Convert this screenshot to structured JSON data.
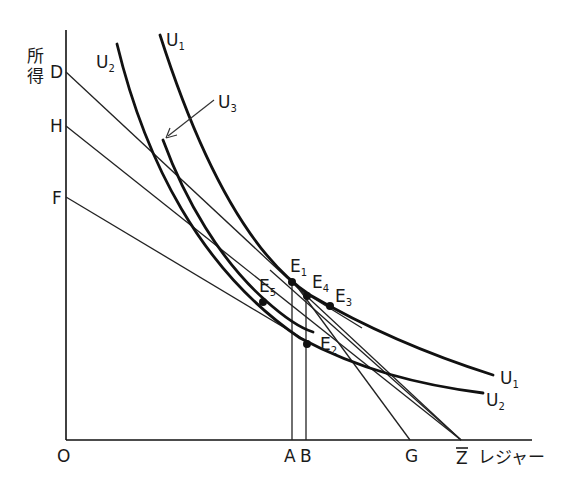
{
  "axes": {
    "y_label": "所得",
    "x_label": "レジャー",
    "origin": "O",
    "y_ticks": [
      "D",
      "H",
      "F"
    ],
    "x_ticks": [
      "A",
      "B",
      "G",
      "Z̄"
    ]
  },
  "curves": [
    {
      "name": "U1",
      "label": "U",
      "sub": "1"
    },
    {
      "name": "U2",
      "label": "U",
      "sub": "2"
    },
    {
      "name": "U3",
      "label": "U",
      "sub": "3"
    }
  ],
  "points": [
    {
      "name": "E1",
      "label": "E",
      "sub": "1"
    },
    {
      "name": "E2",
      "label": "E",
      "sub": "2"
    },
    {
      "name": "E3",
      "label": "E",
      "sub": "3"
    },
    {
      "name": "E4",
      "label": "E",
      "sub": "4"
    },
    {
      "name": "E5",
      "label": "E",
      "sub": "5"
    }
  ],
  "budget_lines": [
    {
      "from": "D",
      "to": "Z̄"
    },
    {
      "from": "H",
      "to": "Z̄"
    },
    {
      "from": "F",
      "to": "E2"
    },
    {
      "from": "E4",
      "to": "Z̄",
      "note": "steeper wage line"
    },
    {
      "from": "E1",
      "to": "G"
    }
  ]
}
